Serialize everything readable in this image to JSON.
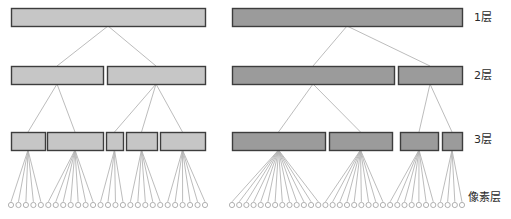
{
  "figure": {
    "title": "",
    "background": "#ffffff"
  },
  "style": {
    "left_box_fill": "#c6c6c6",
    "right_box_fill": "#9b9b9b",
    "box_stroke": "#3d3d3d",
    "edge_color": "#b4b4b4",
    "leaf_stroke": "#a8a8a8",
    "leaf_fill": "#ffffff",
    "label_color": "#2b2b2b"
  },
  "labels": {
    "level1": "1层",
    "level2": "2层",
    "level3": "3层",
    "pixel": "像素层"
  },
  "label_positions": {
    "level1": {
      "x": 474,
      "y": 12
    },
    "level2": {
      "x": 474,
      "y": 70
    },
    "level3": {
      "x": 474,
      "y": 134
    },
    "pixel": {
      "x": 468,
      "y": 192
    }
  },
  "rows": {
    "level1_y": 8,
    "level2_y": 66,
    "level3_y": 132,
    "leaf_y": 205,
    "box_height": 18
  },
  "left_tree": {
    "name": "left-tree",
    "fill": "#c6c6c6",
    "level1": [
      {
        "id": "L1-0",
        "x": 11,
        "w": 194
      }
    ],
    "level2": [
      {
        "id": "L2-0",
        "x": 11,
        "w": 92
      },
      {
        "id": "L2-1",
        "x": 107,
        "w": 98
      }
    ],
    "level3": [
      {
        "id": "L3-0",
        "x": 11,
        "w": 34,
        "leaves": 5
      },
      {
        "id": "L3-1",
        "x": 47,
        "w": 56,
        "leaves": 7
      },
      {
        "id": "L3-2",
        "x": 106,
        "w": 17,
        "leaves": 4
      },
      {
        "id": "L3-3",
        "x": 126,
        "w": 31,
        "leaves": 5
      },
      {
        "id": "L3-4",
        "x": 160,
        "w": 45,
        "leaves": 6
      }
    ],
    "edges_l1_l2": [
      {
        "from": "L1-0",
        "to": "L2-0"
      },
      {
        "from": "L1-0",
        "to": "L2-1"
      }
    ],
    "edges_l2_l3": [
      {
        "from": "L2-0",
        "to": "L3-0"
      },
      {
        "from": "L2-0",
        "to": "L3-1"
      },
      {
        "from": "L2-1",
        "to": "L3-2"
      },
      {
        "from": "L2-1",
        "to": "L3-3"
      },
      {
        "from": "L2-1",
        "to": "L3-4"
      }
    ],
    "leaf_total": 27
  },
  "right_tree": {
    "name": "right-tree",
    "fill": "#9b9b9b",
    "level1": [
      {
        "id": "R1-0",
        "x": 232,
        "w": 230
      }
    ],
    "level2": [
      {
        "id": "R2-0",
        "x": 232,
        "w": 162
      },
      {
        "id": "R2-1",
        "x": 398,
        "w": 64
      }
    ],
    "level3": [
      {
        "id": "R3-0",
        "x": 232,
        "w": 93,
        "leaves": 13
      },
      {
        "id": "R3-1",
        "x": 329,
        "w": 63,
        "leaves": 9
      },
      {
        "id": "R3-2",
        "x": 400,
        "w": 38,
        "leaves": 7
      },
      {
        "id": "R3-3",
        "x": 442,
        "w": 20,
        "leaves": 4
      }
    ],
    "edges_l1_l2": [
      {
        "from": "R1-0",
        "to": "R2-0"
      },
      {
        "from": "R1-0",
        "to": "R2-1"
      }
    ],
    "edges_l2_l3": [
      {
        "from": "R2-0",
        "to": "R3-0"
      },
      {
        "from": "R2-0",
        "to": "R3-1"
      },
      {
        "from": "R2-1",
        "to": "R3-2"
      },
      {
        "from": "R2-1",
        "to": "R3-3"
      }
    ],
    "leaf_total": 33
  }
}
